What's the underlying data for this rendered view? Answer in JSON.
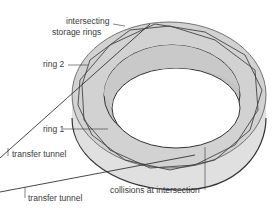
{
  "diagram": {
    "subject": "intersecting storage rings",
    "labels": {
      "intersecting_1": "intersecting",
      "intersecting_2": "storage rings",
      "ring2": "ring 2",
      "ring1": "ring 1",
      "tunnel1": "transfer tunnel",
      "tunnel2": "transfer tunnel",
      "collisions": "collisions at intersection"
    },
    "colors": {
      "ring_top": "#d4d4d4",
      "ring_side": "#e2e2e2",
      "ring_inner": "#c8c8c8",
      "outline": "#3a3a3a",
      "background": "#ffffff"
    }
  }
}
